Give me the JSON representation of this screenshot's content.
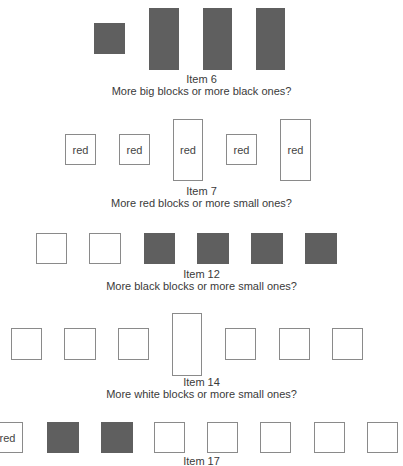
{
  "items": [
    {
      "label": "Item 6",
      "question": "More big blocks or more black ones?",
      "caption_top": 73,
      "blocks": [
        {
          "x": 94,
          "y": 23,
          "w": 31,
          "h": 31,
          "fill": "black",
          "text": ""
        },
        {
          "x": 149,
          "y": 8,
          "w": 30,
          "h": 62,
          "fill": "black",
          "text": ""
        },
        {
          "x": 203,
          "y": 8,
          "w": 29,
          "h": 62,
          "fill": "black",
          "text": ""
        },
        {
          "x": 256,
          "y": 8,
          "w": 29,
          "h": 62,
          "fill": "black",
          "text": ""
        }
      ]
    },
    {
      "label": "Item 7",
      "question": "More red blocks or more small ones?",
      "caption_top": 185,
      "blocks": [
        {
          "x": 65,
          "y": 134,
          "w": 31,
          "h": 31,
          "fill": "white",
          "text": "red"
        },
        {
          "x": 119,
          "y": 134,
          "w": 31,
          "h": 31,
          "fill": "white",
          "text": "red"
        },
        {
          "x": 173,
          "y": 119,
          "w": 30,
          "h": 62,
          "fill": "white",
          "text": "red"
        },
        {
          "x": 226,
          "y": 134,
          "w": 31,
          "h": 31,
          "fill": "white",
          "text": "red"
        },
        {
          "x": 280,
          "y": 119,
          "w": 31,
          "h": 62,
          "fill": "white",
          "text": "red"
        }
      ]
    },
    {
      "label": "Item 12",
      "question": "More black blocks or more small ones?",
      "caption_top": 268,
      "blocks": [
        {
          "x": 36,
          "y": 233,
          "w": 31,
          "h": 31,
          "fill": "white",
          "text": ""
        },
        {
          "x": 89,
          "y": 233,
          "w": 32,
          "h": 31,
          "fill": "white",
          "text": ""
        },
        {
          "x": 144,
          "y": 233,
          "w": 31,
          "h": 31,
          "fill": "black",
          "text": ""
        },
        {
          "x": 197,
          "y": 233,
          "w": 32,
          "h": 31,
          "fill": "black",
          "text": ""
        },
        {
          "x": 251,
          "y": 233,
          "w": 32,
          "h": 31,
          "fill": "black",
          "text": ""
        },
        {
          "x": 305,
          "y": 233,
          "w": 32,
          "h": 31,
          "fill": "black",
          "text": ""
        }
      ]
    },
    {
      "label": "Item 14",
      "question": "More white blocks or more small ones?",
      "caption_top": 376,
      "blocks": [
        {
          "x": 11,
          "y": 328,
          "w": 31,
          "h": 32,
          "fill": "white",
          "text": ""
        },
        {
          "x": 64,
          "y": 328,
          "w": 32,
          "h": 32,
          "fill": "white",
          "text": ""
        },
        {
          "x": 118,
          "y": 328,
          "w": 31,
          "h": 32,
          "fill": "white",
          "text": ""
        },
        {
          "x": 172,
          "y": 313,
          "w": 30,
          "h": 63,
          "fill": "white",
          "text": ""
        },
        {
          "x": 225,
          "y": 328,
          "w": 31,
          "h": 32,
          "fill": "white",
          "text": ""
        },
        {
          "x": 279,
          "y": 328,
          "w": 31,
          "h": 32,
          "fill": "white",
          "text": ""
        },
        {
          "x": 332,
          "y": 328,
          "w": 31,
          "h": 32,
          "fill": "white",
          "text": ""
        }
      ]
    },
    {
      "label": "Item 17",
      "question": "",
      "caption_top": 455,
      "blocks": [
        {
          "x": -8,
          "y": 422,
          "w": 31,
          "h": 31,
          "fill": "white",
          "text": "red"
        },
        {
          "x": 47,
          "y": 422,
          "w": 32,
          "h": 31,
          "fill": "black",
          "text": ""
        },
        {
          "x": 101,
          "y": 422,
          "w": 32,
          "h": 31,
          "fill": "black",
          "text": ""
        },
        {
          "x": 154,
          "y": 422,
          "w": 31,
          "h": 31,
          "fill": "white",
          "text": ""
        },
        {
          "x": 207,
          "y": 422,
          "w": 31,
          "h": 31,
          "fill": "white",
          "text": ""
        },
        {
          "x": 260,
          "y": 422,
          "w": 31,
          "h": 31,
          "fill": "white",
          "text": ""
        },
        {
          "x": 314,
          "y": 422,
          "w": 31,
          "h": 31,
          "fill": "white",
          "text": ""
        },
        {
          "x": 367,
          "y": 422,
          "w": 31,
          "h": 31,
          "fill": "white",
          "text": ""
        }
      ]
    }
  ]
}
